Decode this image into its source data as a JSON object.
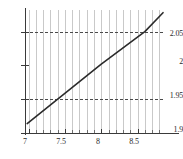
{
  "chart_data": {
    "type": "line",
    "title": "",
    "subtitle": "",
    "xlabel": "",
    "ylabel": "",
    "xlim": [
      6.95,
      8.85
    ],
    "ylim": [
      1.9,
      2.082
    ],
    "grid": true,
    "grid_axis": "x",
    "legend": false,
    "legend_position": "none",
    "x_ticks_major": [
      7,
      7.5,
      8,
      8.5
    ],
    "x_tick_labels": [
      "7",
      "7.5",
      "8",
      "8.5"
    ],
    "x_ticks_minor": [
      7.1,
      7.2,
      7.3,
      7.4,
      7.6,
      7.7,
      7.8,
      7.9,
      8.1,
      8.2,
      8.3,
      8.4,
      8.6,
      8.7,
      8.8
    ],
    "y_ticks_major": [
      1.9,
      1.95,
      2,
      2.05
    ],
    "y_tick_labels": [
      "1.9",
      "1.95",
      "2",
      "2.05"
    ],
    "gridlines_x": [
      7.0,
      7.1,
      7.2,
      7.3,
      7.4,
      7.5,
      7.6,
      7.7,
      7.8,
      7.9,
      8.0,
      8.1,
      8.2,
      8.3,
      8.4,
      8.5,
      8.6,
      8.7,
      8.8
    ],
    "reference_lines_y": [
      1.95,
      2.05
    ],
    "reference_line_style": "dashed",
    "reference_line_color": "#4a4a4a",
    "series": [
      {
        "name": "line",
        "color": "#2b2b2b",
        "style": "solid",
        "width": 1.6,
        "x": [
          6.98,
          7.4,
          8.0,
          8.6,
          8.85
        ],
        "y": [
          1.914,
          1.95,
          2.002,
          2.05,
          2.078
        ]
      }
    ]
  },
  "axes": {
    "axis_color": "#3a3a3a",
    "gridline_color": "#c9c9c9",
    "background": "#ffffff"
  },
  "labels": {
    "y": {
      "t0": "1.9",
      "t1": "1.95",
      "t2": "2",
      "t3": "2.05"
    },
    "x": {
      "t0": "7",
      "t1": "7.5",
      "t2": "8",
      "t3": "8.5"
    }
  }
}
